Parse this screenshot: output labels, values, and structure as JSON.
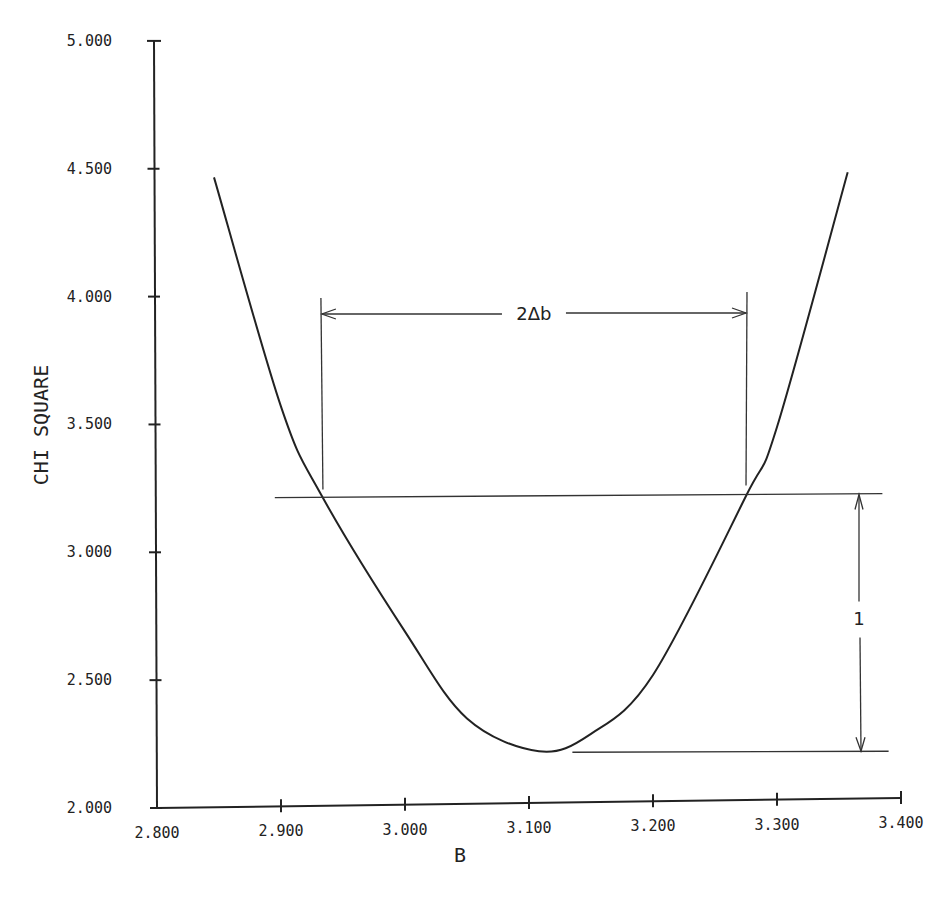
{
  "chart_data": {
    "type": "line",
    "title": "",
    "xlabel": "B",
    "ylabel": "CHI SQUARE",
    "xlim": [
      2.8,
      3.4
    ],
    "ylim": [
      2.0,
      5.0
    ],
    "grid": false,
    "legend": null,
    "x_ticks": [
      "2.800",
      "2.900",
      "3.000",
      "3.100",
      "3.200",
      "3.300",
      "3.400"
    ],
    "y_ticks": [
      "2.000",
      "2.500",
      "3.000",
      "3.500",
      "4.000",
      "4.500",
      "5.000"
    ],
    "series": [
      {
        "name": "chi-square curve",
        "shape": "parabola",
        "x": [
          2.846,
          2.9,
          2.933,
          3.0,
          3.05,
          3.108,
          3.15,
          3.2,
          3.275,
          3.3,
          3.357
        ],
        "y": [
          4.466,
          3.57,
          3.22,
          2.69,
          2.35,
          2.222,
          2.29,
          2.52,
          3.22,
          3.49,
          4.486
        ]
      }
    ],
    "minimum": {
      "x": 3.108,
      "y": 2.222
    },
    "annotations": {
      "threshold_line": {
        "y": 3.222,
        "x_start": 2.895,
        "x_end": 3.385
      },
      "minimum_line": {
        "y": 2.222,
        "x_start": 3.135,
        "x_end": 3.39
      },
      "width_label": "2Δb",
      "width_range": [
        2.933,
        3.275
      ],
      "height_label": "1"
    }
  }
}
